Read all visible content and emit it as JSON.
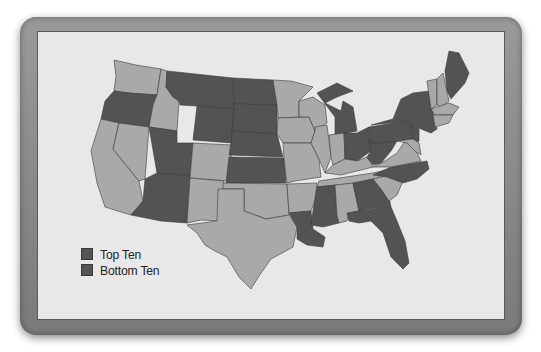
{
  "map": {
    "type": "choropleth",
    "region": "Contiguous United States",
    "colors": {
      "top_ten": "#535353",
      "bottom_ten": "#535353",
      "other": "#a9a9a9",
      "background": "#e8e8e8",
      "frame": "#8a8a8a"
    },
    "legend": {
      "items": [
        {
          "label": "Top Ten",
          "color": "#535353"
        },
        {
          "label": "Bottom Ten",
          "color": "#535353"
        }
      ]
    },
    "highlighted_states_dark": [
      "Oregon",
      "Montana",
      "North Dakota",
      "South Dakota",
      "Wyoming",
      "Nebraska",
      "Utah",
      "Kansas",
      "Arizona",
      "Michigan",
      "Ohio",
      "West Virginia",
      "Pennsylvania",
      "New York",
      "Maine",
      "North Carolina",
      "Georgia",
      "Florida",
      "Mississippi",
      "Louisiana",
      "New Jersey"
    ],
    "other_states_light": [
      "Washington",
      "Idaho",
      "California",
      "Nevada",
      "Colorado",
      "New Mexico",
      "Texas",
      "Oklahoma",
      "Minnesota",
      "Iowa",
      "Missouri",
      "Arkansas",
      "Wisconsin",
      "Illinois",
      "Indiana",
      "Kentucky",
      "Tennessee",
      "Alabama",
      "South Carolina",
      "Virginia",
      "Maryland",
      "Delaware",
      "Vermont",
      "New Hampshire",
      "Massachusetts",
      "Connecticut",
      "Rhode Island"
    ]
  }
}
